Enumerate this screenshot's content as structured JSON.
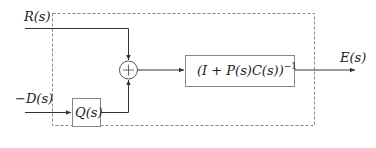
{
  "diagram": {
    "type": "block-diagram",
    "inputs": {
      "r": {
        "label": "R(s)"
      },
      "d": {
        "label": "−D(s)"
      }
    },
    "output": {
      "label": "E(s)"
    },
    "blocks": {
      "q": {
        "label": "Q(s)"
      },
      "closed_loop": {
        "label_main": "(I + P(s)C(s))",
        "label_exp": "−1"
      }
    },
    "junction": {
      "symbol": "+"
    },
    "boundary": {
      "style": "dashed"
    },
    "colors": {
      "line": "#333333",
      "dashed": "#777777",
      "block_border": "#888888"
    }
  }
}
